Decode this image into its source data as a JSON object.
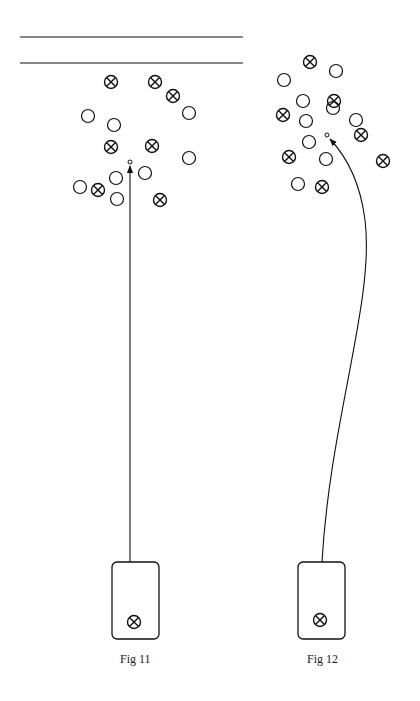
{
  "figures": [
    {
      "label": "Fig 11",
      "walls": [
        {
          "x1": 20,
          "x2": 243,
          "y": 37
        },
        {
          "x1": 20,
          "x2": 243,
          "y": 63
        }
      ],
      "plain": [
        [
          88,
          116
        ],
        [
          114,
          125
        ],
        [
          189,
          113
        ],
        [
          189,
          158
        ],
        [
          80,
          187
        ],
        [
          116,
          178
        ],
        [
          145,
          173
        ],
        [
          117,
          199
        ]
      ],
      "crossed": [
        [
          111,
          82
        ],
        [
          155,
          82
        ],
        [
          173,
          96
        ],
        [
          111,
          147
        ],
        [
          152,
          146
        ],
        [
          98,
          190
        ],
        [
          160,
          200
        ]
      ],
      "target": [
        130,
        162
      ],
      "box": {
        "x": 112,
        "y": 562,
        "w": 47,
        "h": 77,
        "crossed": [
          134,
          622
        ]
      },
      "path": "M 130 562 L 130 166",
      "label_pos": [
        120,
        652
      ]
    },
    {
      "label": "Fig 12",
      "walls": [],
      "plain": [
        [
          284,
          80
        ],
        [
          336,
          71
        ],
        [
          303,
          101
        ],
        [
          333,
          108
        ],
        [
          306,
          121
        ],
        [
          356,
          120
        ],
        [
          309,
          142
        ],
        [
          326,
          159
        ],
        [
          298,
          184
        ]
      ],
      "crossed": [
        [
          310,
          62
        ],
        [
          283,
          115
        ],
        [
          334,
          101
        ],
        [
          361,
          135
        ],
        [
          289,
          157
        ],
        [
          383,
          161
        ],
        [
          322,
          187
        ]
      ],
      "target": [
        327,
        135
      ],
      "box": {
        "x": 298,
        "y": 562,
        "w": 47,
        "h": 77,
        "crossed": [
          320,
          620
        ]
      },
      "path": "M 322 562 C 330 420, 375 300, 365 220 C 360 180, 345 155, 330 139",
      "label_pos": [
        307,
        652
      ]
    }
  ]
}
